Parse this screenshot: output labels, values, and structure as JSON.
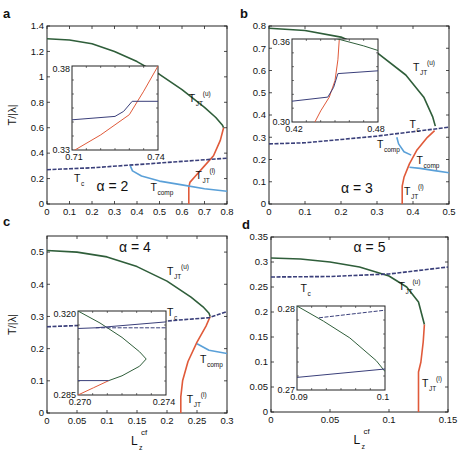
{
  "figure": {
    "ylabel": "T/|λ|",
    "xlabel_main": "L",
    "xlabel_sub": "z",
    "xlabel_sup": "cf"
  },
  "colors": {
    "upper": "#2f5e3a",
    "lower": "#e05a3a",
    "tc": "#3a3f7a",
    "tcomp": "#5aa0d8",
    "axis": "#222222"
  },
  "chart_data": [
    {
      "panel": "a",
      "type": "line",
      "title": "α = 2",
      "xlabel": "L_z^cf",
      "ylabel": "T/|λ|",
      "xlim": [
        0,
        0.8
      ],
      "ylim": [
        0,
        1.4
      ],
      "xticks": [
        0,
        0.1,
        0.2,
        0.3,
        0.4,
        0.5,
        0.6,
        0.7,
        0.8
      ],
      "xtick_labels": [
        "0",
        "0.1",
        "0.2",
        "0.3",
        "0.4",
        "0.5",
        "0.6",
        "0.7",
        "0.8"
      ],
      "yticks": [
        0,
        0.2,
        0.4,
        0.6,
        0.8,
        1.0,
        1.2,
        1.4
      ],
      "ytick_labels": [
        "0",
        "0.2",
        "0.4",
        "0.6",
        "0.8",
        "1",
        "1.2",
        "1.4"
      ],
      "series": [
        {
          "name": "T_JT^(u)",
          "color": "upper",
          "x": [
            0,
            0.1,
            0.2,
            0.3,
            0.4,
            0.5,
            0.6,
            0.7,
            0.75,
            0.78,
            0.785
          ],
          "y": [
            1.3,
            1.29,
            1.26,
            1.2,
            1.12,
            1.02,
            0.9,
            0.76,
            0.68,
            0.62,
            0.6
          ]
        },
        {
          "name": "T_JT^(l)",
          "color": "lower",
          "x": [
            0.63,
            0.63,
            0.635,
            0.66,
            0.7,
            0.74,
            0.77,
            0.785
          ],
          "y": [
            0,
            0.13,
            0.17,
            0.22,
            0.3,
            0.38,
            0.5,
            0.6
          ]
        },
        {
          "name": "T_c",
          "color": "tc",
          "x": [
            0,
            0.2,
            0.4,
            0.6,
            0.8
          ],
          "y": [
            0.27,
            0.285,
            0.31,
            0.335,
            0.36
          ],
          "dashed": true
        },
        {
          "name": "T_comp",
          "color": "tcomp",
          "x": [
            0.37,
            0.38,
            0.42,
            0.5,
            0.6,
            0.7,
            0.8
          ],
          "y": [
            0.3,
            0.26,
            0.22,
            0.18,
            0.15,
            0.12,
            0.1
          ]
        }
      ],
      "labels": [
        {
          "text": "T",
          "sub": "JT",
          "sup": "(u)",
          "x": 0.63,
          "y": 0.8
        },
        {
          "text": "T",
          "sub": "JT",
          "sup": "(l)",
          "x": 0.66,
          "y": 0.2
        },
        {
          "text": "T",
          "sub": "c",
          "sup": "",
          "x": 0.12,
          "y": 0.17
        },
        {
          "text": "T",
          "sub": "comp",
          "sup": "",
          "x": 0.46,
          "y": 0.1
        },
        {
          "text": "α = 2",
          "sub": "",
          "sup": "",
          "x": 0.22,
          "y": 0.1,
          "big": true
        }
      ],
      "inset": {
        "xlim": [
          0.71,
          0.74
        ],
        "ylim": [
          0.33,
          0.38
        ],
        "xtick_labels": [
          "0.71",
          "0.74"
        ],
        "ytick_labels": [
          "0.33",
          "0.38"
        ],
        "series": [
          {
            "color": "lower",
            "x": [
              0.711,
              0.72,
              0.725,
              0.73,
              0.735,
              0.74
            ],
            "y": [
              0.33,
              0.339,
              0.345,
              0.351,
              0.365,
              0.38
            ]
          },
          {
            "color": "tc",
            "x": [
              0.71,
              0.725,
              0.728,
              0.731,
              0.74
            ],
            "y": [
              0.348,
              0.35,
              0.353,
              0.359,
              0.359
            ]
          }
        ]
      }
    },
    {
      "panel": "b",
      "type": "line",
      "title": "α = 3",
      "xlabel": "L_z^cf",
      "ylabel": "",
      "xlim": [
        0,
        0.5
      ],
      "ylim": [
        0,
        0.8
      ],
      "xticks": [
        0,
        0.1,
        0.2,
        0.3,
        0.4,
        0.5
      ],
      "xtick_labels": [
        "0",
        "0.1",
        "0.2",
        "0.3",
        "0.4",
        "0.5"
      ],
      "yticks": [
        0,
        0.1,
        0.2,
        0.3,
        0.4,
        0.5,
        0.6,
        0.7,
        0.8
      ],
      "ytick_labels": [
        "0",
        "0.1",
        "0.2",
        "0.3",
        "0.4",
        "0.5",
        "0.6",
        "0.7",
        "0.8"
      ],
      "series": [
        {
          "name": "T_JT^(u)",
          "color": "upper",
          "x": [
            0,
            0.1,
            0.2,
            0.3,
            0.38,
            0.43,
            0.455,
            0.462
          ],
          "y": [
            0.79,
            0.78,
            0.75,
            0.68,
            0.58,
            0.48,
            0.39,
            0.35
          ]
        },
        {
          "name": "T_JT^(l)",
          "color": "lower",
          "x": [
            0.37,
            0.37,
            0.375,
            0.39,
            0.41,
            0.44,
            0.46
          ],
          "y": [
            0,
            0.08,
            0.12,
            0.18,
            0.24,
            0.3,
            0.33
          ]
        },
        {
          "name": "T_c",
          "color": "tc",
          "x": [
            0,
            0.1,
            0.2,
            0.3,
            0.4,
            0.5
          ],
          "y": [
            0.27,
            0.275,
            0.29,
            0.305,
            0.325,
            0.345
          ],
          "dashed": true
        },
        {
          "name": "T_comp",
          "color": "tcomp",
          "x": [
            0.355,
            0.36,
            0.375,
            0.395
          ],
          "y": [
            0.3,
            0.27,
            0.235,
            0.22
          ]
        },
        {
          "name": "T_comp",
          "color": "tcomp",
          "x": [
            0.39,
            0.42,
            0.46,
            0.5
          ],
          "y": [
            0.165,
            0.16,
            0.15,
            0.14
          ]
        }
      ],
      "labels": [
        {
          "text": "T",
          "sub": "JT",
          "sup": "(u)",
          "x": 0.4,
          "y": 0.6
        },
        {
          "text": "T",
          "sub": "c",
          "sup": "",
          "x": 0.39,
          "y": 0.34
        },
        {
          "text": "T",
          "sub": "comp",
          "sup": "",
          "x": 0.3,
          "y": 0.25
        },
        {
          "text": "T",
          "sub": "comp",
          "sup": "",
          "x": 0.41,
          "y": 0.18
        },
        {
          "text": "T",
          "sub": "JT",
          "sup": "(l)",
          "x": 0.375,
          "y": 0.04
        },
        {
          "text": "α = 3",
          "sub": "",
          "sup": "",
          "x": 0.2,
          "y": 0.05,
          "big": true
        }
      ],
      "inset": {
        "xlim": [
          0.42,
          0.48
        ],
        "ylim": [
          0.3,
          0.36
        ],
        "xtick_labels": [
          "0.42",
          "0.48"
        ],
        "ytick_labels": [
          "0.30",
          "0.36"
        ],
        "series": [
          {
            "color": "lower",
            "x": [
              0.436,
              0.44,
              0.446,
              0.45,
              0.452,
              0.453
            ],
            "y": [
              0.3,
              0.308,
              0.318,
              0.33,
              0.345,
              0.36
            ]
          },
          {
            "color": "tc",
            "x": [
              0.42,
              0.445,
              0.449,
              0.452,
              0.48
            ],
            "y": [
              0.315,
              0.318,
              0.325,
              0.335,
              0.337
            ]
          },
          {
            "color": "upper",
            "x": [
              0.415,
              0.43,
              0.452,
              0.47,
              0.485
            ],
            "y": [
              0.368,
              0.366,
              0.36,
              0.355,
              0.35
            ]
          }
        ]
      }
    },
    {
      "panel": "c",
      "type": "line",
      "title": "α = 4",
      "xlabel": "L_z^cf",
      "ylabel": "T/|λ|",
      "xlim": [
        0,
        0.3
      ],
      "ylim": [
        0,
        0.55
      ],
      "xticks": [
        0,
        0.05,
        0.1,
        0.15,
        0.2,
        0.25,
        0.3
      ],
      "xtick_labels": [
        "0",
        "0.05",
        "0.1",
        "0.15",
        "0.2",
        "0.25",
        "0.3"
      ],
      "yticks": [
        0,
        0.1,
        0.2,
        0.3,
        0.4,
        0.5
      ],
      "ytick_labels": [
        "0",
        "0.1",
        "0.2",
        "0.3",
        "0.4",
        "0.5"
      ],
      "series": [
        {
          "name": "T_JT^(u)",
          "color": "upper",
          "x": [
            0,
            0.05,
            0.1,
            0.15,
            0.2,
            0.24,
            0.26,
            0.27,
            0.272
          ],
          "y": [
            0.505,
            0.5,
            0.485,
            0.455,
            0.41,
            0.36,
            0.33,
            0.31,
            0.3
          ]
        },
        {
          "name": "T_JT^(l)",
          "color": "lower",
          "x": [
            0.223,
            0.223,
            0.226,
            0.235,
            0.25,
            0.265,
            0.272
          ],
          "y": [
            0,
            0.05,
            0.1,
            0.16,
            0.22,
            0.27,
            0.3
          ]
        },
        {
          "name": "T_c",
          "color": "tc",
          "x": [
            0,
            0.1,
            0.2,
            0.27,
            0.3
          ],
          "y": [
            0.268,
            0.276,
            0.286,
            0.296,
            0.315
          ],
          "dashed": true
        },
        {
          "name": "T_comp",
          "color": "tcomp",
          "x": [
            0.25,
            0.27,
            0.3
          ],
          "y": [
            0.215,
            0.195,
            0.185
          ]
        }
      ],
      "labels": [
        {
          "text": "T",
          "sub": "JT",
          "sup": "(u)",
          "x": 0.2,
          "y": 0.43
        },
        {
          "text": "T",
          "sub": "c",
          "sup": "",
          "x": 0.2,
          "y": 0.3
        },
        {
          "text": "T",
          "sub": "comp",
          "sup": "",
          "x": 0.255,
          "y": 0.155
        },
        {
          "text": "T",
          "sub": "JT",
          "sup": "(l)",
          "x": 0.233,
          "y": 0.03
        },
        {
          "text": "α = 4",
          "sub": "",
          "sup": "",
          "x": 0.12,
          "y": 0.5,
          "big": true
        }
      ],
      "inset": {
        "xlim": [
          0.27,
          0.274
        ],
        "ylim": [
          0.285,
          0.32
        ],
        "xtick_labels": [
          "0.270",
          "0.274"
        ],
        "ytick_labels": [
          "0.285",
          "0.320"
        ],
        "series": [
          {
            "color": "upper",
            "x": [
              0.27,
              0.271,
              0.272,
              0.2728,
              0.2731,
              0.2728,
              0.272,
              0.2714
            ],
            "y": [
              0.32,
              0.315,
              0.309,
              0.303,
              0.3,
              0.297,
              0.293,
              0.291
            ]
          },
          {
            "color": "lower",
            "x": [
              0.27,
              0.2707,
              0.2714
            ],
            "y": [
              0.285,
              0.288,
              0.291
            ]
          },
          {
            "color": "tc",
            "x": [
              0.27,
              0.2714
            ],
            "y": [
              0.291,
              0.291
            ]
          },
          {
            "color": "tc",
            "x": [
              0.2708,
              0.274
            ],
            "y": [
              0.313,
              0.313
            ],
            "dashed": true
          },
          {
            "color": "tc",
            "x": [
              0.268,
              0.2708,
              0.276
            ],
            "y": [
              0.312,
              0.313,
              0.317
            ]
          }
        ]
      }
    },
    {
      "panel": "d",
      "type": "line",
      "title": "α = 5",
      "xlabel": "L_z^cf",
      "ylabel": "",
      "xlim": [
        0,
        0.15
      ],
      "ylim": [
        0,
        0.35
      ],
      "xticks": [
        0,
        0.05,
        0.1,
        0.15
      ],
      "xtick_labels": [
        "0",
        "0.05",
        "0.1",
        "0.15"
      ],
      "yticks": [
        0,
        0.05,
        0.1,
        0.15,
        0.2,
        0.25,
        0.3,
        0.35
      ],
      "ytick_labels": [
        "0",
        "0.05",
        "0.1",
        "0.15",
        "0.2",
        "0.25",
        "0.3",
        "0.35"
      ],
      "series": [
        {
          "name": "T_JT^(u)",
          "color": "upper",
          "x": [
            0,
            0.025,
            0.05,
            0.075,
            0.1,
            0.115,
            0.125,
            0.13
          ],
          "y": [
            0.308,
            0.306,
            0.3,
            0.29,
            0.272,
            0.25,
            0.22,
            0.175
          ]
        },
        {
          "name": "T_JT^(l)",
          "color": "lower",
          "x": [
            0.125,
            0.125,
            0.127,
            0.129,
            0.13
          ],
          "y": [
            0,
            0.08,
            0.1,
            0.14,
            0.175
          ]
        },
        {
          "name": "T_c",
          "color": "tc",
          "x": [
            0,
            0.05,
            0.1,
            0.15
          ],
          "y": [
            0.27,
            0.271,
            0.276,
            0.29
          ],
          "dashed": true
        }
      ],
      "labels": [
        {
          "text": "T",
          "sub": "c",
          "sup": "",
          "x": 0.025,
          "y": 0.24
        },
        {
          "text": "T",
          "sub": "JT",
          "sup": "(u)",
          "x": 0.108,
          "y": 0.245
        },
        {
          "text": "T",
          "sub": "JT",
          "sup": "(l)",
          "x": 0.128,
          "y": 0.05
        },
        {
          "text": "α = 5",
          "sub": "",
          "sup": "",
          "x": 0.07,
          "y": 0.32,
          "big": true
        }
      ],
      "inset": {
        "xlim": [
          0.09,
          0.1
        ],
        "ylim": [
          0.27,
          0.28
        ],
        "xtick_labels": [
          "0.09",
          "0.1"
        ],
        "ytick_labels": [
          "0.27",
          "0.28"
        ],
        "series": [
          {
            "color": "upper",
            "x": [
              0.09,
              0.093,
              0.096,
              0.099,
              0.1
            ],
            "y": [
              0.28,
              0.2782,
              0.2762,
              0.2735,
              0.2722
            ]
          },
          {
            "color": "tc",
            "x": [
              0.09,
              0.1
            ],
            "y": [
              0.2715,
              0.2725
            ]
          },
          {
            "color": "tc",
            "x": [
              0.0925,
              0.1
            ],
            "y": [
              0.2786,
              0.2795
            ],
            "dashed": true
          }
        ]
      }
    }
  ],
  "panels": [
    {
      "letter": "a",
      "box": [
        47,
        26,
        227,
        204
      ],
      "inset_box": [
        72,
        66,
        158,
        150
      ],
      "show_xlabel": false,
      "show_ylabel": true
    },
    {
      "letter": "b",
      "box": [
        269,
        26,
        449,
        204
      ],
      "inset_box": [
        292,
        39,
        378,
        122
      ],
      "show_xlabel": false,
      "show_ylabel": false
    },
    {
      "letter": "c",
      "box": [
        47,
        236,
        227,
        413
      ],
      "inset_box": [
        78,
        311,
        166,
        395
      ],
      "show_xlabel": true,
      "show_ylabel": true
    },
    {
      "letter": "d",
      "box": [
        271,
        237,
        448,
        412
      ],
      "inset_box": [
        297,
        306,
        385,
        390
      ],
      "show_xlabel": true,
      "show_ylabel": false
    }
  ]
}
